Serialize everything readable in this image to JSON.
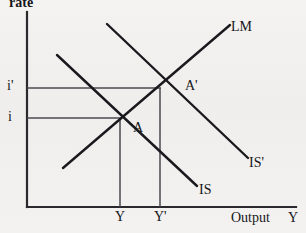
{
  "figure": {
    "type": "diagram",
    "subtype": "IS-LM macroeconomic model",
    "background_color": "#f1f0ee",
    "ink_color": "#16161a"
  },
  "axes": {
    "y_axis_label": "rate",
    "x_axis_label_primary": "Output",
    "x_axis_label_secondary": "Y",
    "y_ticks": [
      {
        "label": "i'",
        "value_y": 88
      },
      {
        "label": "i",
        "value_y": 118
      }
    ],
    "x_ticks": [
      {
        "label": "Y",
        "value_x": 120
      },
      {
        "label": "Y'",
        "value_x": 160
      }
    ]
  },
  "curves": [
    {
      "name": "LM",
      "label": "LM",
      "slope": "upward",
      "x1": 63,
      "y1": 168,
      "x2": 230,
      "y2": 25
    },
    {
      "name": "IS",
      "label": "IS",
      "slope": "downward",
      "x1": 57,
      "y1": 55,
      "x2": 197,
      "y2": 186
    },
    {
      "name": "IS'",
      "label": "IS'",
      "slope": "downward",
      "x1": 107,
      "y1": 24,
      "x2": 248,
      "y2": 158
    }
  ],
  "points": [
    {
      "name": "A",
      "label": "A",
      "x": 120,
      "y": 118
    },
    {
      "name": "A-prime",
      "label": "A'",
      "x": 160,
      "y": 88
    }
  ],
  "guide_lines": [
    {
      "name": "i-prime-horizontal",
      "from_x": 27,
      "to_x": 160,
      "y": 88
    },
    {
      "name": "i-horizontal",
      "from_x": 27,
      "to_x": 120,
      "y": 118
    },
    {
      "name": "Y-vertical",
      "x": 120,
      "from_y": 118,
      "to_y": 207
    },
    {
      "name": "Y-prime-vertical",
      "x": 160,
      "from_y": 88,
      "to_y": 207
    }
  ],
  "labels": {
    "rate": "rate",
    "lm": "LM",
    "is": "IS",
    "is_prime": "IS'",
    "a": "A",
    "a_prime": "A'",
    "i": "i",
    "i_prime": "i'",
    "y": "Y",
    "y_prime": "Y'",
    "output": "Output",
    "axis_y": "Y"
  }
}
